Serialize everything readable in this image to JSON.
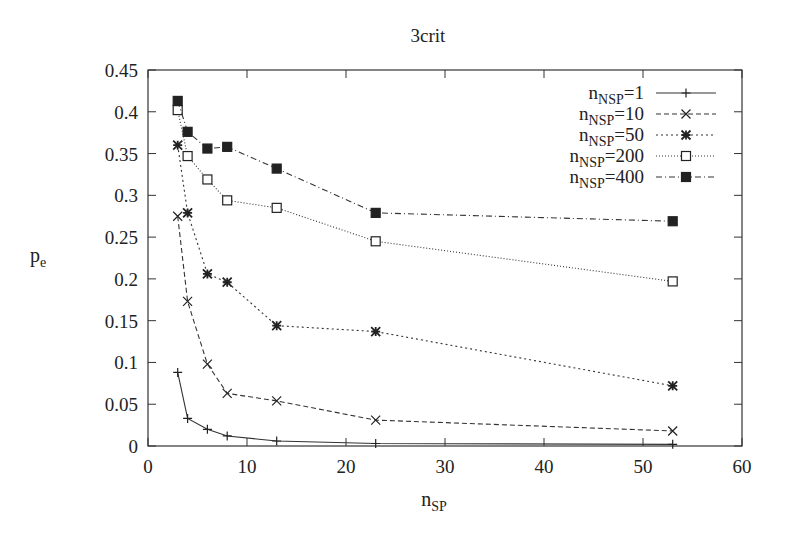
{
  "chart_data": {
    "type": "line",
    "title": "3crit",
    "xlabel": "n_SP",
    "ylabel": "p_e",
    "xlim": [
      0,
      60
    ],
    "ylim": [
      0,
      0.45
    ],
    "xticks": [
      0,
      10,
      20,
      30,
      40,
      50,
      60
    ],
    "yticks": [
      0,
      0.05,
      0.1,
      0.15,
      0.2,
      0.25,
      0.3,
      0.35,
      0.4,
      0.45
    ],
    "ytick_labels": [
      "0",
      "0.05",
      "0.1",
      "0.15",
      "0.2",
      "0.25",
      "0.3",
      "0.35",
      "0.4",
      "0.45"
    ],
    "grid": false,
    "legend_position": "top-right",
    "x": [
      3,
      4,
      6,
      8,
      13,
      23,
      53
    ],
    "series": [
      {
        "name": "n_NSP=1",
        "label_main": "n",
        "label_sub": "NSP",
        "label_rest": "=1",
        "marker": "plus",
        "dash": "",
        "values": [
          0.088,
          0.033,
          0.02,
          0.012,
          0.006,
          0.003,
          0.002
        ]
      },
      {
        "name": "n_NSP=10",
        "label_main": "n",
        "label_sub": "NSP",
        "label_rest": "=10",
        "marker": "cross",
        "dash": "5,3",
        "values": [
          0.275,
          0.173,
          0.098,
          0.063,
          0.054,
          0.031,
          0.018
        ]
      },
      {
        "name": "n_NSP=50",
        "label_main": "n",
        "label_sub": "NSP",
        "label_rest": "=50",
        "marker": "star",
        "dash": "2,3",
        "values": [
          0.36,
          0.279,
          0.206,
          0.196,
          0.144,
          0.137,
          0.072
        ]
      },
      {
        "name": "n_NSP=200",
        "label_main": "n",
        "label_sub": "NSP",
        "label_rest": "=200",
        "marker": "open-square",
        "dash": "1,2",
        "values": [
          0.402,
          0.347,
          0.319,
          0.294,
          0.285,
          0.245,
          0.197
        ]
      },
      {
        "name": "n_NSP=400",
        "label_main": "n",
        "label_sub": "NSP",
        "label_rest": "=400",
        "marker": "filled-square",
        "dash": "6,3,1,3",
        "values": [
          0.413,
          0.376,
          0.356,
          0.358,
          0.332,
          0.279,
          0.269
        ]
      }
    ]
  }
}
